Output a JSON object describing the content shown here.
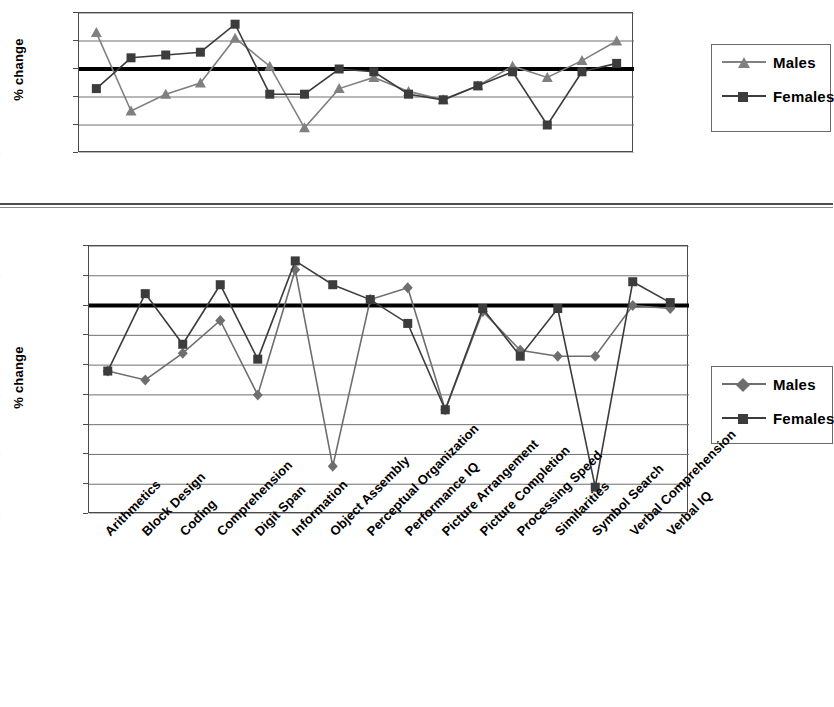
{
  "page": {
    "background": "#ffffff",
    "divider_color": "#4d4d4d"
  },
  "colors": {
    "males": "#808080",
    "females": "#3c3c3c",
    "zero_line": "#000000",
    "gridline": "#707070",
    "axis": "#4a4a4a"
  },
  "categories": [
    "Arithmetics",
    "Block Design",
    "Coding",
    "Comprehension",
    "Digit Span",
    "Information",
    "Object Assembly",
    "Perceptual Organization",
    "Performance IQ",
    "Picture Arrangement",
    "Picture Completion",
    "Processing Speed",
    "Similarities",
    "Symbol Search",
    "Verbal Comprehension",
    "Verbal IQ"
  ],
  "legend": {
    "males_label": "Males",
    "females_label": "Females"
  },
  "chart_data": [
    {
      "id": "top-chart",
      "type": "line",
      "title": "",
      "xlabel": "",
      "ylabel": "% change",
      "ylim": [
        -15,
        10
      ],
      "yticks": [
        10,
        5,
        0,
        -5,
        -10,
        -15
      ],
      "ytick_labels": [
        "10",
        "5",
        "0",
        "-5",
        "-10",
        "-15"
      ],
      "grid": true,
      "zero_line": 0,
      "legend_position": "right",
      "x_axis_labels_shown": false,
      "categories": [
        "Arithmetics",
        "Block Design",
        "Coding",
        "Comprehension",
        "Digit Span",
        "Information",
        "Object Assembly",
        "Perceptual Organization",
        "Performance IQ",
        "Picture Arrangement",
        "Picture Completion",
        "Processing Speed",
        "Similarities",
        "Symbol Search",
        "Verbal Comprehension",
        "Verbal IQ"
      ],
      "series": [
        {
          "name": "Males",
          "marker": "triangle",
          "color": "#808080",
          "values": [
            6.5,
            -7.5,
            -4.5,
            -2.5,
            5.5,
            0.5,
            -10.5,
            -3.5,
            -1.5,
            -4.0,
            -5.5,
            -3.0,
            0.5,
            -1.5,
            1.5,
            5.0
          ]
        },
        {
          "name": "Females",
          "marker": "square",
          "color": "#3c3c3c",
          "values": [
            -3.5,
            2.0,
            2.5,
            3.0,
            8.0,
            -4.5,
            -4.5,
            0.0,
            -0.5,
            -4.5,
            -5.5,
            -3.0,
            -0.5,
            -10.0,
            -0.5,
            1.0
          ]
        }
      ]
    },
    {
      "id": "bottom-chart",
      "type": "line",
      "title": "",
      "xlabel": "",
      "ylabel": "% change",
      "ylim": [
        -35,
        10
      ],
      "yticks": [
        10,
        5,
        0,
        -5,
        -10,
        -15,
        -20,
        -25,
        -30,
        -35
      ],
      "ytick_labels": [
        "10",
        "5",
        "0",
        "-5",
        "-10",
        "-15",
        "-20",
        "-25",
        "-30",
        "-35"
      ],
      "grid": true,
      "zero_line": 0,
      "legend_position": "right",
      "x_axis_labels_shown": true,
      "categories": [
        "Arithmetics",
        "Block Design",
        "Coding",
        "Comprehension",
        "Digit Span",
        "Information",
        "Object Assembly",
        "Perceptual Organization",
        "Performance IQ",
        "Picture Arrangement",
        "Picture Completion",
        "Processing Speed",
        "Similarities",
        "Symbol Search",
        "Verbal Comprehension",
        "Verbal IQ"
      ],
      "series": [
        {
          "name": "Males",
          "marker": "diamond",
          "color": "#6e6e6e",
          "values": [
            -11.0,
            -12.5,
            -8.0,
            -2.5,
            -15.0,
            6.0,
            -27.0,
            1.0,
            3.0,
            -17.5,
            -1.0,
            -7.5,
            -8.5,
            -8.5,
            0.0,
            -0.5
          ]
        },
        {
          "name": "Females",
          "marker": "square",
          "color": "#3c3c3c",
          "values": [
            -11.0,
            2.0,
            -6.5,
            3.5,
            -9.0,
            7.5,
            3.5,
            1.0,
            -3.0,
            -17.5,
            -0.5,
            -8.5,
            -0.5,
            -30.5,
            4.0,
            0.5
          ]
        }
      ]
    }
  ]
}
